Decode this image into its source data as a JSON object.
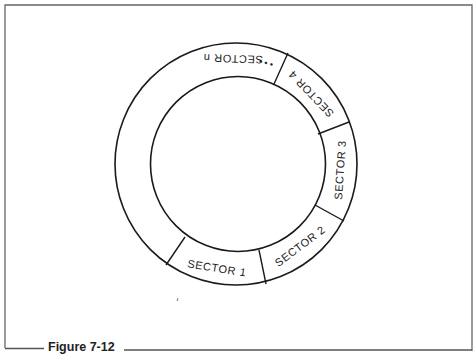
{
  "figure": {
    "caption": "Figure 7-12",
    "frame_color": "#555555",
    "line_color": "#1a1a1a"
  },
  "ring": {
    "center": [
      237,
      164
    ],
    "outer_radius": 121,
    "inner_radius": 87,
    "sectors": [
      {
        "id": "sector-1",
        "label": "SECTOR 1"
      },
      {
        "id": "sector-2",
        "label": "SECTOR 2"
      },
      {
        "id": "sector-3",
        "label": "SECTOR 3"
      },
      {
        "id": "sector-4",
        "label": "SECTOR 4"
      },
      {
        "id": "sector-n",
        "label": "SECTOR n"
      }
    ],
    "ellipsis": "• • •"
  }
}
